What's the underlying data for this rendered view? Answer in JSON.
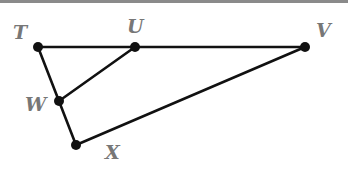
{
  "diagram": {
    "type": "geometry-figure",
    "points": [
      {
        "id": "T",
        "label": "T",
        "x": 38,
        "y": 47,
        "label_x": 13,
        "label_y": 39
      },
      {
        "id": "U",
        "label": "U",
        "x": 135,
        "y": 47,
        "label_x": 127,
        "label_y": 33
      },
      {
        "id": "V",
        "label": "V",
        "x": 305,
        "y": 47,
        "label_x": 316,
        "label_y": 37
      },
      {
        "id": "W",
        "label": "W",
        "x": 59,
        "y": 101,
        "label_x": 25,
        "label_y": 111
      },
      {
        "id": "X",
        "label": "X",
        "x": 76,
        "y": 145,
        "label_x": 105,
        "label_y": 159
      }
    ],
    "segments": [
      {
        "from": "T",
        "to": "V",
        "name": "TV"
      },
      {
        "from": "T",
        "to": "X",
        "name": "TX"
      },
      {
        "from": "U",
        "to": "W",
        "name": "UW"
      },
      {
        "from": "X",
        "to": "V",
        "name": "XV"
      }
    ],
    "colors": {
      "line": "#111111",
      "point": "#111111",
      "label": "#777777",
      "top_border": "#8a8a8a"
    }
  }
}
